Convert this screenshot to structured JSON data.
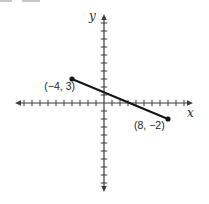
{
  "figure": {
    "background": "#ffffff",
    "axis_color": "#3d3d3d",
    "segment_color": "#151515",
    "text_color": "#242424"
  },
  "chart_data": {
    "type": "line",
    "title": "",
    "xlabel": "x",
    "ylabel": "y",
    "x_range": [
      -11,
      11
    ],
    "y_range": [
      -11,
      11
    ],
    "tick_step": 1,
    "grid": false,
    "legend": false,
    "series": [
      {
        "name": "segment",
        "points": [
          {
            "x": -4,
            "y": 3,
            "label": "(−4, 3)"
          },
          {
            "x": 8,
            "y": -2,
            "label": "(8, −2)"
          }
        ]
      }
    ]
  }
}
